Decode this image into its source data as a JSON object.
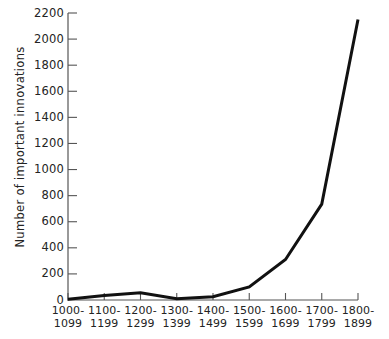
{
  "chart_data": {
    "type": "line",
    "title": "",
    "xlabel": "",
    "ylabel": "Number of important innovations",
    "categories": [
      "1000-1099",
      "1100-1199",
      "1200-1299",
      "1300-1399",
      "1400-1499",
      "1500-1599",
      "1600-1699",
      "1700-1799",
      "1800-1899"
    ],
    "category_lines": [
      [
        "1000-",
        "1099"
      ],
      [
        "1100-",
        "1199"
      ],
      [
        "1200-",
        "1299"
      ],
      [
        "1300-",
        "1399"
      ],
      [
        "1400-",
        "1499"
      ],
      [
        "1500-",
        "1599"
      ],
      [
        "1600-",
        "1699"
      ],
      [
        "1700-",
        "1799"
      ],
      [
        "1800-",
        "1899"
      ]
    ],
    "values": [
      5,
      35,
      55,
      10,
      25,
      100,
      310,
      735,
      2150
    ],
    "ylim": [
      0,
      2200
    ],
    "ytick_values": [
      0,
      200,
      400,
      600,
      800,
      1000,
      1200,
      1400,
      1600,
      1800,
      2000,
      2200
    ],
    "ytick_labels": [
      "0",
      "200",
      "400",
      "600",
      "800",
      "1000",
      "1200",
      "1400",
      "1600",
      "1800",
      "2000",
      "2200"
    ],
    "grid": false,
    "legend": false,
    "line_color": "#111111",
    "axis_color": "#555555",
    "background": "#ffffff"
  }
}
